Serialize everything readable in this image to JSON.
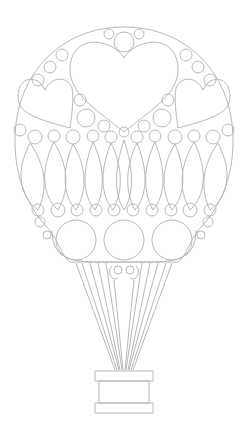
{
  "artwork": {
    "subject": "hot air balloon coloring page",
    "stroke_color": "#b8b8b8",
    "background": "#ffffff",
    "elements": {
      "envelope": "balloon envelope with hearts and circles",
      "center_heart": "large heart",
      "side_hearts": 2,
      "gore_panels": 11,
      "lower_circles": 3,
      "ropes": 12,
      "basket": "basket"
    }
  }
}
